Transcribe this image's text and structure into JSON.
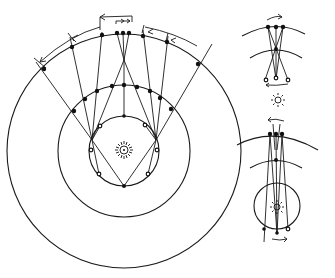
{
  "diagram": {
    "title": "",
    "colors": {
      "ink": "#1a1a1a",
      "background": "#ffffff"
    },
    "main": {
      "sun": {
        "cx": 124,
        "cy": 150,
        "label_icon": "sun-icon"
      },
      "orbits": [
        {
          "name": "inner-orbit",
          "cx": 124,
          "cy": 151,
          "r": 35
        },
        {
          "name": "middle-orbit",
          "cx": 124,
          "cy": 151,
          "r": 66
        },
        {
          "name": "outer-sphere",
          "cx": 124,
          "cy": 151,
          "r": 117
        }
      ],
      "arrows": [
        {
          "name": "retrograde-arc-left",
          "direction": "left"
        },
        {
          "name": "retrograde-arc-right",
          "direction": "left"
        },
        {
          "name": "top-bracket-arrow",
          "direction": "left"
        },
        {
          "name": "small-forward-arrows",
          "direction": "right"
        }
      ]
    },
    "insets": [
      {
        "name": "inset-top",
        "arrow_top": "right",
        "arrow_bottom": "left"
      },
      {
        "name": "inset-bottom",
        "arrow_top": "left",
        "arrow_bottom": "right"
      }
    ]
  }
}
